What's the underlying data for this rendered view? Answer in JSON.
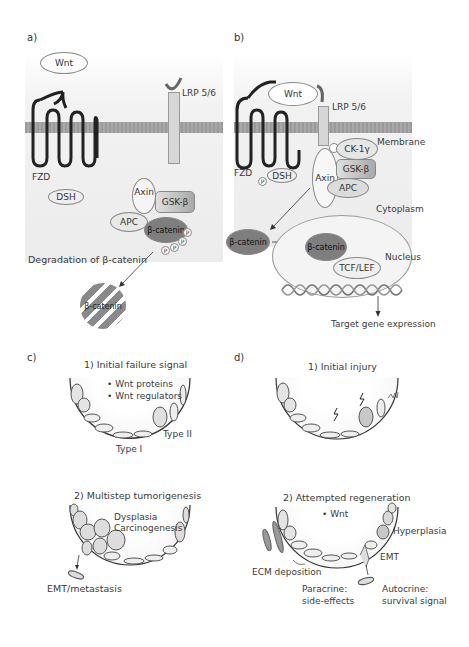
{
  "panels": {
    "a": {
      "letter": "a)",
      "wnt": "Wnt",
      "lrp": "LRP 5/6",
      "fzd": "FZD",
      "dsh": "DSH",
      "axin": "Axin",
      "gsk": "GSK-β",
      "apc": "APC",
      "bcat": "β-catenin",
      "p": "P",
      "degradation": "Degradation of β-catenin",
      "degraded_bcat": "β-catenin"
    },
    "b": {
      "letter": "b)",
      "wnt": "Wnt",
      "lrp": "LRP 5/6",
      "membrane": "Membrane",
      "ck": "CK-1γ",
      "fzd": "FZD",
      "dsh": "DSH",
      "p": "P",
      "axin": "Axin",
      "gsk": "GSK-β",
      "apc": "APC",
      "cytoplasm": "Cytoplasm",
      "bcat_cyto": "β-catenin",
      "bcat_nuc": "β-catenin",
      "nucleus": "Nucleus",
      "tcf": "TCF/LEF",
      "target": "Target gene expression"
    },
    "c": {
      "letter": "c)",
      "step1_title": "1) Initial failure signal",
      "bullet1": "• Wnt proteins",
      "bullet2": "• Wnt regulators",
      "type2": "Type II",
      "type1": "Type I",
      "step2_title": "2) Multistep tumorigenesis",
      "dysplasia": "Dysplasia",
      "carcinogenesis": "Carcinogenesis",
      "emt": "EMT/metastasis"
    },
    "d": {
      "letter": "d)",
      "step1_title": "1) Initial injury",
      "step2_title": "2) Attempted regeneration",
      "wnt": "• Wnt",
      "hyperplasia": "Hyperplasia",
      "emt": "EMT",
      "ecm": "ECM deposition",
      "paracrine": "Paracrine:",
      "paracrine2": "side-effects",
      "autocrine": "Autocrine:",
      "autocrine2": "survival signal"
    }
  },
  "colors": {
    "membrane": "#a0a0a0",
    "bcatenin": "#7a7a7a",
    "gsk": "#b5b5b5",
    "ellipse_fill": "#efefef",
    "receptor": "#222222"
  }
}
